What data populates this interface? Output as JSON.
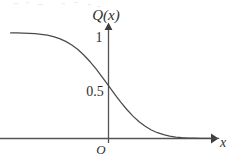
{
  "figure": {
    "background_color": "#ffffff",
    "stroke_color": "#4a4a4a",
    "axis_color": "#545454",
    "text_color": "#2e2e2e"
  },
  "labels": {
    "y_axis": "Q(x)",
    "x_axis": "x",
    "origin": "O",
    "tick_one": "1",
    "tick_half": "0.5"
  },
  "chart_data": {
    "type": "line",
    "title": "",
    "xlabel": "x",
    "ylabel": "Q(x)",
    "grid": false,
    "legend": null,
    "xlim": [
      -3.2,
      3.6
    ],
    "ylim": [
      0,
      1.12
    ],
    "ytick_labels": [
      "0.5",
      "1"
    ],
    "ytick_values": [
      0.5,
      1
    ],
    "xtick_labels": [
      "O"
    ],
    "xtick_values": [
      0
    ],
    "annotations": [
      "O"
    ],
    "series": [
      {
        "name": "Q(x)",
        "x": [
          -3.2,
          -3.0,
          -2.8,
          -2.6,
          -2.4,
          -2.2,
          -2.0,
          -1.8,
          -1.6,
          -1.4,
          -1.2,
          -1.0,
          -0.8,
          -0.6,
          -0.4,
          -0.2,
          0.0,
          0.2,
          0.4,
          0.6,
          0.8,
          1.0,
          1.2,
          1.4,
          1.6,
          1.8,
          2.0,
          2.2,
          2.4,
          2.6,
          2.8,
          3.0,
          3.2,
          3.4,
          3.6
        ],
        "y": [
          0.999,
          0.9987,
          0.9974,
          0.9953,
          0.9918,
          0.9861,
          0.9772,
          0.9641,
          0.9452,
          0.9192,
          0.8849,
          0.8413,
          0.7881,
          0.7257,
          0.6554,
          0.5793,
          0.5,
          0.4207,
          0.3446,
          0.2743,
          0.2119,
          0.1587,
          0.1151,
          0.0808,
          0.0548,
          0.0359,
          0.0228,
          0.0139,
          0.0082,
          0.0047,
          0.0026,
          0.0013,
          0.0007,
          0.0003,
          0.0002
        ]
      }
    ]
  }
}
